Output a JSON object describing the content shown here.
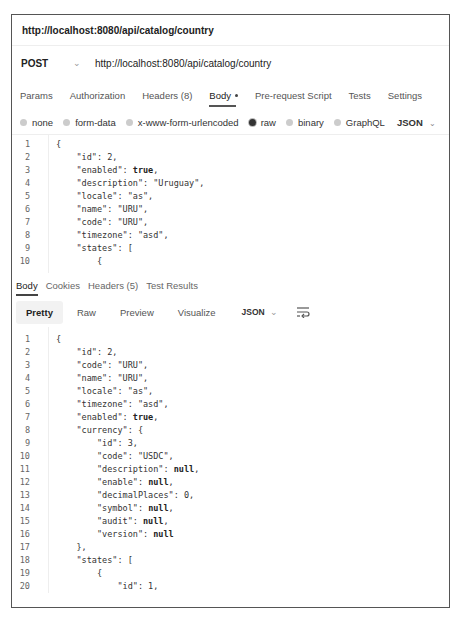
{
  "title": "http://localhost:8080/api/catalog/country",
  "request": {
    "method": "POST",
    "url": "http://localhost:8080/api/catalog/country"
  },
  "tabs": [
    {
      "label": "Params"
    },
    {
      "label": "Authorization"
    },
    {
      "label": "Headers (8)"
    },
    {
      "label": "Body"
    },
    {
      "label": "Pre-request Script"
    },
    {
      "label": "Tests"
    },
    {
      "label": "Settings"
    }
  ],
  "body_types": [
    {
      "label": "none"
    },
    {
      "label": "form-data"
    },
    {
      "label": "x-www-form-urlencoded"
    },
    {
      "label": "raw"
    },
    {
      "label": "binary"
    },
    {
      "label": "GraphQL"
    }
  ],
  "body_format": "JSON",
  "request_body": [
    {
      "n": "1",
      "text": "{"
    },
    {
      "n": "2",
      "text": "    \"id\": 2,"
    },
    {
      "n": "3",
      "text": "    \"enabled\": ",
      "kw": "true",
      "tail": ","
    },
    {
      "n": "4",
      "text": "    \"description\": \"Uruguay\","
    },
    {
      "n": "5",
      "text": "    \"locale\": \"as\","
    },
    {
      "n": "6",
      "text": "    \"name\": \"URU\","
    },
    {
      "n": "7",
      "text": "    \"code\": \"URU\","
    },
    {
      "n": "8",
      "text": "    \"timezone\": \"asd\","
    },
    {
      "n": "9",
      "text": "    \"states\": ["
    },
    {
      "n": "10",
      "text": "        {"
    }
  ],
  "response_tabs": [
    {
      "label": "Body"
    },
    {
      "label": "Cookies"
    },
    {
      "label": "Headers (5)"
    },
    {
      "label": "Test Results"
    }
  ],
  "response_views": [
    {
      "label": "Pretty"
    },
    {
      "label": "Raw"
    },
    {
      "label": "Preview"
    },
    {
      "label": "Visualize"
    }
  ],
  "response_format": "JSON",
  "response_body": [
    {
      "n": "1",
      "text": "{"
    },
    {
      "n": "2",
      "text": "    \"id\": 2,"
    },
    {
      "n": "3",
      "text": "    \"code\": \"URU\","
    },
    {
      "n": "4",
      "text": "    \"name\": \"URU\","
    },
    {
      "n": "5",
      "text": "    \"locale\": \"as\","
    },
    {
      "n": "6",
      "text": "    \"timezone\": \"asd\","
    },
    {
      "n": "7",
      "text": "    \"enabled\": ",
      "kw": "true",
      "tail": ","
    },
    {
      "n": "8",
      "text": "    \"currency\": {"
    },
    {
      "n": "9",
      "text": "        \"id\": 3,"
    },
    {
      "n": "10",
      "text": "        \"code\": \"USDC\","
    },
    {
      "n": "11",
      "text": "        \"description\": ",
      "kw": "null",
      "tail": ","
    },
    {
      "n": "12",
      "text": "        \"enable\": ",
      "kw": "null",
      "tail": ","
    },
    {
      "n": "13",
      "text": "        \"decimalPlaces\": 0,"
    },
    {
      "n": "14",
      "text": "        \"symbol\": ",
      "kw": "null",
      "tail": ","
    },
    {
      "n": "15",
      "text": "        \"audit\": ",
      "kw": "null",
      "tail": ","
    },
    {
      "n": "16",
      "text": "        \"version\": ",
      "kw": "null",
      "tail": ""
    },
    {
      "n": "17",
      "text": "    },"
    },
    {
      "n": "18",
      "text": "    \"states\": ["
    },
    {
      "n": "19",
      "text": "        {"
    },
    {
      "n": "20",
      "text": "            \"id\": 1,"
    }
  ]
}
